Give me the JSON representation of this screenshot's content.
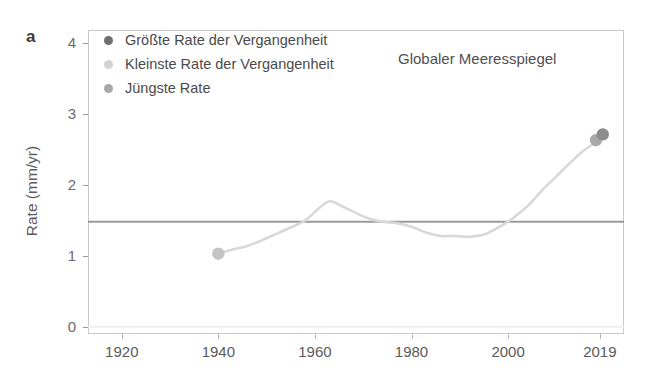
{
  "figure": {
    "panel_label": "a",
    "annotation": "Globaler Meeresspiegel"
  },
  "legend": {
    "position": "top-left-inside",
    "items": [
      {
        "label": "Größte Rate der Vergangenheit",
        "color": "#6f6f6f",
        "name": "largest-past-rate"
      },
      {
        "label": "Kleinste Rate der Vergangenheit",
        "color": "#d2d2d2",
        "name": "smallest-past-rate"
      },
      {
        "label": "Jüngste Rate",
        "color": "#a8a8a8",
        "name": "most-recent-rate"
      }
    ]
  },
  "axes": {
    "ylabel": "Rate (mm/yr)",
    "xlabel": "",
    "yticks": [
      0,
      1,
      2,
      3,
      4
    ],
    "ytick_labels": [
      "0",
      "1",
      "2",
      "3",
      "4"
    ],
    "xticks": [
      1920,
      1940,
      1960,
      1980,
      2000,
      2019
    ],
    "xtick_labels": [
      "1920",
      "1940",
      "1960",
      "1980",
      "2000",
      "2019"
    ]
  },
  "colors": {
    "curve": "#d8d8d8",
    "reference_line": "#9a9a9a",
    "baseline": "#f0f0f0",
    "frame": "#c9c9c9",
    "text": "#4a4a4a"
  },
  "chart_data": {
    "type": "line",
    "title": "",
    "subtitle": "",
    "annotation": "Globaler Meeresspiegel",
    "xlabel": "",
    "ylabel": "Rate (mm/yr)",
    "xlim": [
      1913,
      2024
    ],
    "ylim": [
      -0.1,
      4.18
    ],
    "grid": false,
    "legend_position": "upper left",
    "xticks": [
      1920,
      1940,
      1960,
      1980,
      2000,
      2019
    ],
    "yticks": [
      0,
      1,
      2,
      3,
      4
    ],
    "series": [
      {
        "name": "Globaler Meeresspiegel",
        "type": "line",
        "color": "#d8d8d8",
        "x": [
          1940,
          1943,
          1946,
          1949,
          1952,
          1955,
          1958,
          1961,
          1963,
          1965,
          1968,
          1971,
          1974,
          1977,
          1980,
          1983,
          1986,
          1989,
          1992,
          1995,
          1998,
          2001,
          2004,
          2007,
          2010,
          2013,
          2016,
          2019
        ],
        "values": [
          1.03,
          1.09,
          1.14,
          1.22,
          1.31,
          1.4,
          1.5,
          1.68,
          1.77,
          1.72,
          1.62,
          1.53,
          1.48,
          1.46,
          1.41,
          1.33,
          1.28,
          1.28,
          1.27,
          1.3,
          1.4,
          1.53,
          1.7,
          1.92,
          2.12,
          2.32,
          2.5,
          2.63
        ]
      }
    ],
    "reference_lines": [
      {
        "name": "mittlere-rate-linie",
        "orientation": "horizontal",
        "y": 1.48,
        "color": "#9a9a9a"
      },
      {
        "name": "nulllinie",
        "orientation": "horizontal",
        "y": 0.0,
        "color": "#f0f0f0"
      }
    ],
    "points": [
      {
        "name": "kleinste-rate-der-vergangenheit",
        "label": "Kleinste Rate der Vergangenheit",
        "x": 1940,
        "y": 1.03,
        "color": "#c4c4c4"
      },
      {
        "name": "juengste-rate",
        "label": "Jüngste Rate",
        "x": 2018.2,
        "y": 2.63,
        "color": "#a8a8a8"
      },
      {
        "name": "groesste-rate-der-vergangenheit",
        "label": "Größte Rate der Vergangenheit",
        "x": 2019.6,
        "y": 2.71,
        "color": "#8c8c8c"
      }
    ]
  }
}
